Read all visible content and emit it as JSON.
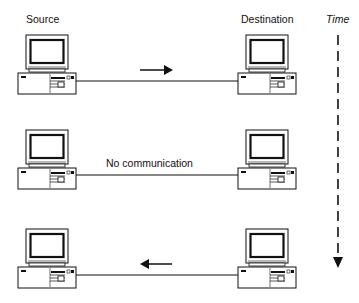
{
  "labels": {
    "source": "Source",
    "destination": "Destination",
    "time": "Time",
    "no_communication": "No communication"
  },
  "rows": [
    {
      "name": "row-1",
      "message_direction": "source-to-destination",
      "label": ""
    },
    {
      "name": "row-2",
      "message_direction": "none",
      "label": "No communication"
    },
    {
      "name": "row-3",
      "message_direction": "destination-to-source",
      "label": ""
    }
  ],
  "icons": [
    "desktop-computer-icon",
    "arrow-right-icon",
    "arrow-left-icon",
    "time-axis-arrow-icon"
  ],
  "colors": {
    "stroke": "#111111",
    "background": "#ffffff"
  }
}
